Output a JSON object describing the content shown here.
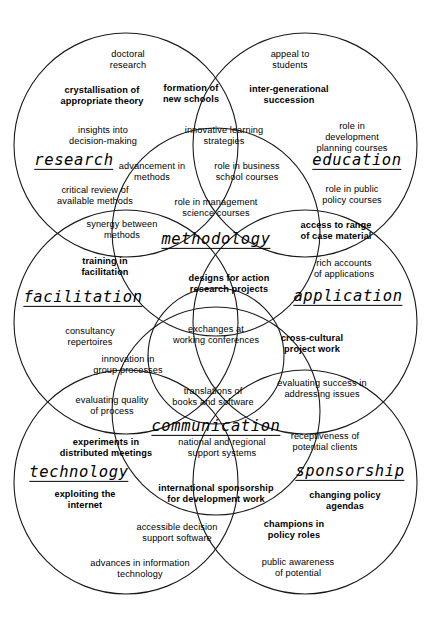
{
  "diagram": {
    "stroke_color": "#1a1a1a",
    "background_color": "#ffffff",
    "text_color": "#000000"
  },
  "circles": [
    {
      "name": "research",
      "cx": 126,
      "cy": 145,
      "r": 112
    },
    {
      "name": "education",
      "cx": 305,
      "cy": 145,
      "r": 112
    },
    {
      "name": "methodology",
      "cx": 216,
      "cy": 232,
      "r": 104
    },
    {
      "name": "facilitation",
      "cx": 126,
      "cy": 322,
      "r": 112
    },
    {
      "name": "application",
      "cx": 305,
      "cy": 322,
      "r": 112
    },
    {
      "name": "centre",
      "cx": 216,
      "cy": 356,
      "r": 68
    },
    {
      "name": "communication",
      "cx": 216,
      "cy": 411,
      "r": 104
    },
    {
      "name": "technology",
      "cx": 126,
      "cy": 482,
      "r": 112
    },
    {
      "name": "sponsorship",
      "cx": 305,
      "cy": 482,
      "r": 112
    }
  ],
  "domains": [
    {
      "id": "research",
      "label": "research",
      "x": 74,
      "y": 161
    },
    {
      "id": "education",
      "label": "education",
      "x": 357,
      "y": 161
    },
    {
      "id": "methodology",
      "label": "methodology",
      "x": 216,
      "y": 240
    },
    {
      "id": "facilitation",
      "label": "facilitation",
      "x": 83,
      "y": 298
    },
    {
      "id": "application",
      "label": "application",
      "x": 348,
      "y": 297
    },
    {
      "id": "communication",
      "label": "communication",
      "x": 216,
      "y": 427
    },
    {
      "id": "technology",
      "label": "technology",
      "x": 79,
      "y": 473
    },
    {
      "id": "sponsorship",
      "label": "sponsorship",
      "x": 350,
      "y": 472
    }
  ],
  "items": [
    {
      "text": "doctoral\nresearch",
      "x": 128,
      "y": 60,
      "weight": "plain"
    },
    {
      "text": "appeal to\nstudents",
      "x": 290,
      "y": 60,
      "weight": "plain"
    },
    {
      "text": "crystallisation of\nappropriate theory",
      "x": 102,
      "y": 96,
      "weight": "bold"
    },
    {
      "text": "formation of\nnew schools",
      "x": 191,
      "y": 94,
      "weight": "bold"
    },
    {
      "text": "inter-generational\nsuccession",
      "x": 289,
      "y": 95,
      "weight": "bold"
    },
    {
      "text": "insights into\ndecision-making",
      "x": 103,
      "y": 136,
      "weight": "plain"
    },
    {
      "text": "innovative learning\nstrategies",
      "x": 224,
      "y": 136,
      "weight": "plain"
    },
    {
      "text": "role in development\nplanning courses",
      "x": 352,
      "y": 137,
      "weight": "plain"
    },
    {
      "text": "advancement in\nmethods",
      "x": 152,
      "y": 172,
      "weight": "plain"
    },
    {
      "text": "role in business\nschool courses",
      "x": 247,
      "y": 172,
      "weight": "plain"
    },
    {
      "text": "critical review of\navailable methods",
      "x": 95,
      "y": 196,
      "weight": "plain"
    },
    {
      "text": "role in public\npolicy courses",
      "x": 352,
      "y": 195,
      "weight": "plain"
    },
    {
      "text": "role in management\nscience courses",
      "x": 216,
      "y": 208,
      "weight": "plain"
    },
    {
      "text": "synergy between\nmethods",
      "x": 122,
      "y": 230,
      "weight": "plain"
    },
    {
      "text": "access to range\nof case material",
      "x": 336,
      "y": 231,
      "weight": "bold"
    },
    {
      "text": "training in\nfacilitation",
      "x": 105,
      "y": 267,
      "weight": "bold"
    },
    {
      "text": "rich accounts\nof applications",
      "x": 344,
      "y": 269,
      "weight": "plain"
    },
    {
      "text": "designs for action\nresearch projects",
      "x": 229,
      "y": 284,
      "weight": "bold"
    },
    {
      "text": "consultancy\nrepertoires",
      "x": 90,
      "y": 337,
      "weight": "plain"
    },
    {
      "text": "exchanges at\nworking conferences",
      "x": 216,
      "y": 335,
      "weight": "plain"
    },
    {
      "text": "cross-cultural\nproject work",
      "x": 312,
      "y": 344,
      "weight": "bold"
    },
    {
      "text": "innovation in\ngroup processes",
      "x": 128,
      "y": 365,
      "weight": "plain"
    },
    {
      "text": "translations of\nbooks and software",
      "x": 213,
      "y": 397,
      "weight": "plain"
    },
    {
      "text": "evaluating success in\naddressing issues",
      "x": 322,
      "y": 389,
      "weight": "plain"
    },
    {
      "text": "evaluating quality\nof process",
      "x": 112,
      "y": 406,
      "weight": "plain"
    },
    {
      "text": "national and regional\nsupport systems",
      "x": 222,
      "y": 448,
      "weight": "plain"
    },
    {
      "text": "receptiveness of\npotential clients",
      "x": 325,
      "y": 442,
      "weight": "plain"
    },
    {
      "text": "experiments in\ndistributed meetings",
      "x": 106,
      "y": 448,
      "weight": "bold"
    },
    {
      "text": "international sponsorship\nfor development work",
      "x": 216,
      "y": 494,
      "weight": "bold"
    },
    {
      "text": "exploiting the\ninternet",
      "x": 85,
      "y": 500,
      "weight": "bold"
    },
    {
      "text": "changing policy\nagendas",
      "x": 345,
      "y": 501,
      "weight": "bold"
    },
    {
      "text": "accessible decision\nsupport software",
      "x": 177,
      "y": 533,
      "weight": "plain"
    },
    {
      "text": "champions in\npolicy roles",
      "x": 294,
      "y": 530,
      "weight": "bold"
    },
    {
      "text": "advances in information\ntechnology",
      "x": 140,
      "y": 569,
      "weight": "plain"
    },
    {
      "text": "public awareness\nof potential",
      "x": 298,
      "y": 568,
      "weight": "plain"
    }
  ]
}
